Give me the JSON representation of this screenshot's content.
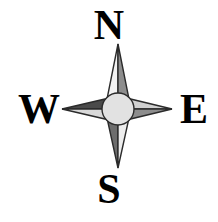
{
  "figure": {
    "type": "compass-rose",
    "width": 218,
    "height": 222,
    "background_color": "#ffffff"
  },
  "labels": {
    "north": "N",
    "east": "E",
    "south": "S",
    "west": "W"
  },
  "geometry": {
    "center_x": 118,
    "center_y": 109,
    "hub_radius": 16,
    "north_tip_y": 44,
    "south_tip_y": 168,
    "west_tip_x": 62,
    "east_tip_x": 172,
    "spike_half_width": 13
  },
  "colors": {
    "outline": "#2b2b2b",
    "hub_fill": "#e2e2e2",
    "north_left": "#f2f2f2",
    "north_right": "#8d8d8d",
    "south_left": "#6d6d6d",
    "south_right": "#ededed",
    "west_top": "#4a4a4a",
    "west_bottom": "#d9d9d9",
    "east_top": "#d0d0d0",
    "east_bottom": "#8d8d8d",
    "label_color": "#000000"
  },
  "chart_data": {
    "type": "diagram",
    "points": [
      {
        "name": "north",
        "label": "N",
        "bearing_degrees": 0,
        "tip_x": 118,
        "tip_y": 44
      },
      {
        "name": "east",
        "label": "E",
        "bearing_degrees": 90,
        "tip_x": 172,
        "tip_y": 109
      },
      {
        "name": "south",
        "label": "S",
        "bearing_degrees": 180,
        "tip_x": 118,
        "tip_y": 168
      },
      {
        "name": "west",
        "label": "W",
        "bearing_degrees": 270,
        "tip_x": 62,
        "tip_y": 109
      }
    ]
  }
}
